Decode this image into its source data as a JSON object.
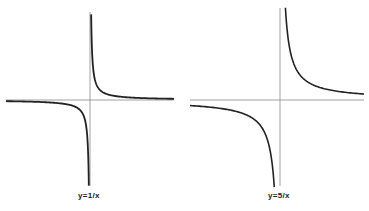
{
  "chart_data": [
    {
      "type": "line",
      "title": "",
      "caption": "y=1/x",
      "function": "1/x",
      "series": [
        {
          "name": "y=1/x",
          "k": 1
        }
      ],
      "axes": {
        "x_ticks": [],
        "y_ticks": [],
        "grid": false
      },
      "asymptotes": [
        "x=0",
        "y=0"
      ]
    },
    {
      "type": "line",
      "title": "",
      "caption": "y=5/x",
      "function": "5/x",
      "series": [
        {
          "name": "y=5/x",
          "k": 5
        }
      ],
      "axes": {
        "x_ticks": [],
        "y_ticks": [],
        "grid": false
      },
      "asymptotes": [
        "x=0",
        "y=0"
      ]
    }
  ],
  "figure": {
    "left_caption": "y=1/x",
    "right_caption": "y=5/x"
  }
}
